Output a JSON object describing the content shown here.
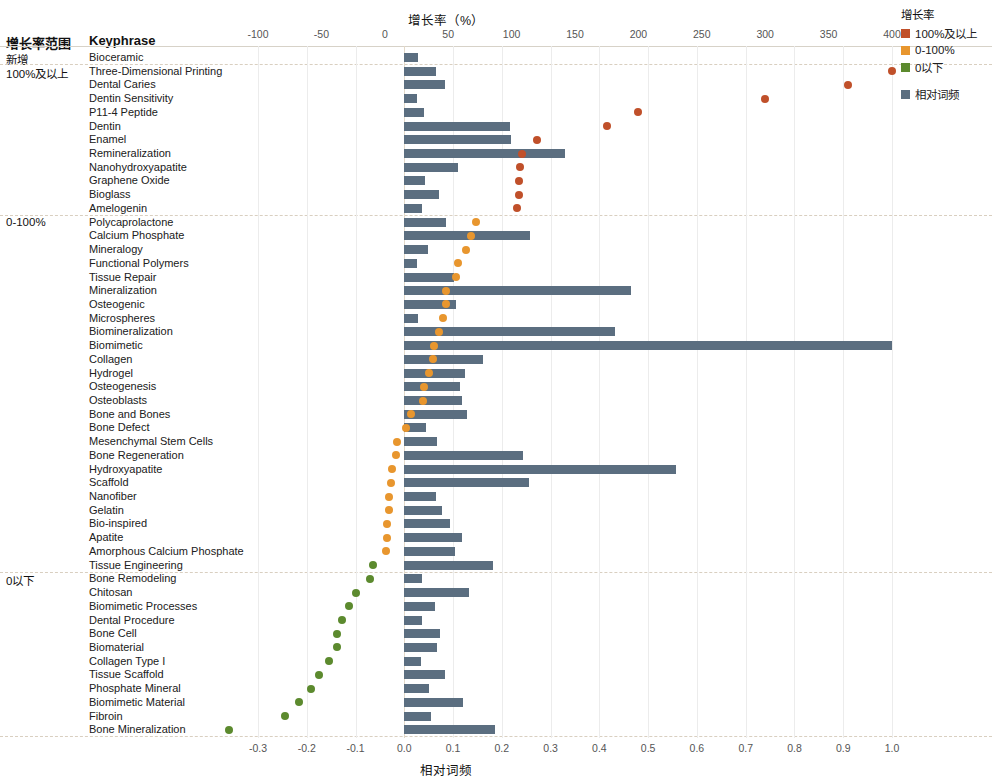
{
  "headers": {
    "group_col": "增长率范围",
    "keyphrase_col": "Keyphrase"
  },
  "axes": {
    "top_title": "增长率（%）",
    "bottom_title": "相对词频",
    "top_ticks": [
      "-100",
      "-50",
      "0",
      "50",
      "100",
      "150",
      "200",
      "250",
      "300",
      "350",
      "400"
    ],
    "bottom_ticks": [
      "-0.3",
      "-0.2",
      "-0.1",
      "0.0",
      "0.1",
      "0.2",
      "0.3",
      "0.4",
      "0.5",
      "0.6",
      "0.7",
      "0.8",
      "0.9",
      "1.0"
    ]
  },
  "legend": {
    "title": "增长率",
    "items": [
      {
        "label": "100%及以上",
        "color": "#c0502a"
      },
      {
        "label": "0-100%",
        "color": "#e8962e"
      },
      {
        "label": "0以下",
        "color": "#5c8a2e"
      }
    ],
    "freq": {
      "label": "相对词频",
      "color": "#5b6e80"
    }
  },
  "groups": [
    {
      "label": "新增",
      "first_row": 0
    },
    {
      "label": "100%及以上",
      "first_row": 1
    },
    {
      "label": "0-100%",
      "first_row": 12
    },
    {
      "label": "0以下",
      "first_row": 38
    }
  ],
  "colors": {
    "bar": "#5b6e80",
    "growth_high": "#c0502a",
    "growth_mid": "#e8962e",
    "growth_low": "#5c8a2e"
  },
  "chart_data": {
    "type": "bar",
    "xlabel_top": "增长率（%）",
    "xlabel_bottom": "相对词频",
    "ylabel": "Keyphrase",
    "xlim_top": [
      -100,
      400
    ],
    "xlim_bottom": [
      -0.3,
      1.0
    ],
    "grid": true,
    "legend_position": "right",
    "series": [
      {
        "name": "相对词频",
        "type": "bar",
        "color": "#5b6e80",
        "axis": "bottom"
      },
      {
        "name": "增长率",
        "type": "scatter",
        "axis": "top"
      }
    ],
    "categories": [
      "Bioceramic",
      "Three-Dimensional Printing",
      "Dental Caries",
      "Dentin Sensitivity",
      "P11-4 Peptide",
      "Dentin",
      "Enamel",
      "Remineralization",
      "Nanohydroxyapatite",
      "Graphene Oxide",
      "Bioglass",
      "Amelogenin",
      "Polycaprolactone",
      "Calcium Phosphate",
      "Mineralogy",
      "Functional Polymers",
      "Tissue Repair",
      "Mineralization",
      "Osteogenic",
      "Microspheres",
      "Biomineralization",
      "Biomimetic",
      "Collagen",
      "Hydrogel",
      "Osteogenesis",
      "Osteoblasts",
      "Bone and Bones",
      "Bone Defect",
      "Mesenchymal Stem Cells",
      "Bone Regeneration",
      "Hydroxyapatite",
      "Scaffold",
      "Nanofiber",
      "Gelatin",
      "Bio-inspired",
      "Apatite",
      "Amorphous Calcium Phosphate",
      "Tissue Engineering",
      "Bone Remodeling",
      "Chitosan",
      "Biomimetic Processes",
      "Dental Procedure",
      "Bone Cell",
      "Biomaterial",
      "Collagen Type I",
      "Tissue Scaffold",
      "Phosphate Mineral",
      "Biomimetic Material",
      "Fibroin",
      "Bone Mineralization"
    ],
    "rows": [
      {
        "keyphrase": "Bioceramic",
        "group": "新增",
        "rel_freq": 0.029,
        "growth": null
      },
      {
        "keyphrase": "Three-Dimensional Printing",
        "group": "100%及以上",
        "rel_freq": 0.066,
        "growth": 400
      },
      {
        "keyphrase": "Dental Caries",
        "group": "100%及以上",
        "rel_freq": 0.083,
        "growth": 365
      },
      {
        "keyphrase": "Dentin Sensitivity",
        "group": "100%及以上",
        "rel_freq": 0.026,
        "growth": 300
      },
      {
        "keyphrase": "P11-4 Peptide",
        "group": "100%及以上",
        "rel_freq": 0.041,
        "growth": 200
      },
      {
        "keyphrase": "Dentin",
        "group": "100%及以上",
        "rel_freq": 0.216,
        "growth": 175
      },
      {
        "keyphrase": "Enamel",
        "group": "100%及以上",
        "rel_freq": 0.218,
        "growth": 120
      },
      {
        "keyphrase": "Remineralization",
        "group": "100%及以上",
        "rel_freq": 0.33,
        "growth": 108
      },
      {
        "keyphrase": "Nanohydroxyapatite",
        "group": "100%及以上",
        "rel_freq": 0.11,
        "growth": 107
      },
      {
        "keyphrase": "Graphene Oxide",
        "group": "100%及以上",
        "rel_freq": 0.043,
        "growth": 106
      },
      {
        "keyphrase": "Bioglass",
        "group": "100%及以上",
        "rel_freq": 0.071,
        "growth": 106
      },
      {
        "keyphrase": "Amelogenin",
        "group": "100%及以上",
        "rel_freq": 0.036,
        "growth": 104
      },
      {
        "keyphrase": "Polycaprolactone",
        "group": "0-100%",
        "rel_freq": 0.085,
        "growth": 72
      },
      {
        "keyphrase": "Calcium Phosphate",
        "group": "0-100%",
        "rel_freq": 0.258,
        "growth": 68
      },
      {
        "keyphrase": "Mineralogy",
        "group": "0-100%",
        "rel_freq": 0.048,
        "growth": 64
      },
      {
        "keyphrase": "Functional Polymers",
        "group": "0-100%",
        "rel_freq": 0.026,
        "growth": 58
      },
      {
        "keyphrase": "Tissue Repair",
        "group": "0-100%",
        "rel_freq": 0.101,
        "growth": 56
      },
      {
        "keyphrase": "Mineralization",
        "group": "0-100%",
        "rel_freq": 0.464,
        "growth": 48
      },
      {
        "keyphrase": "Osteogenic",
        "group": "0-100%",
        "rel_freq": 0.105,
        "growth": 48
      },
      {
        "keyphrase": "Microspheres",
        "group": "0-100%",
        "rel_freq": 0.028,
        "growth": 46
      },
      {
        "keyphrase": "Biomineralization",
        "group": "0-100%",
        "rel_freq": 0.432,
        "growth": 43
      },
      {
        "keyphrase": "Biomimetic",
        "group": "0-100%",
        "rel_freq": 1.0,
        "growth": 39
      },
      {
        "keyphrase": "Collagen",
        "group": "0-100%",
        "rel_freq": 0.161,
        "growth": 38
      },
      {
        "keyphrase": "Hydrogel",
        "group": "0-100%",
        "rel_freq": 0.124,
        "growth": 35
      },
      {
        "keyphrase": "Osteogenesis",
        "group": "0-100%",
        "rel_freq": 0.115,
        "growth": 31
      },
      {
        "keyphrase": "Osteoblasts",
        "group": "0-100%",
        "rel_freq": 0.118,
        "growth": 30
      },
      {
        "keyphrase": "Bone and Bones",
        "group": "0-100%",
        "rel_freq": 0.128,
        "growth": 21
      },
      {
        "keyphrase": "Bone Defect",
        "group": "0-100%",
        "rel_freq": 0.044,
        "growth": 17
      },
      {
        "keyphrase": "Mesenchymal Stem Cells",
        "group": "0-100%",
        "rel_freq": 0.067,
        "growth": 10
      },
      {
        "keyphrase": "Bone Regeneration",
        "group": "0-100%",
        "rel_freq": 0.243,
        "growth": 9
      },
      {
        "keyphrase": "Hydroxyapatite",
        "group": "0-100%",
        "rel_freq": 0.557,
        "growth": 6
      },
      {
        "keyphrase": "Scaffold",
        "group": "0-100%",
        "rel_freq": 0.255,
        "growth": 5
      },
      {
        "keyphrase": "Nanofiber",
        "group": "0-100%",
        "rel_freq": 0.064,
        "growth": 3
      },
      {
        "keyphrase": "Gelatin",
        "group": "0-100%",
        "rel_freq": 0.078,
        "growth": 3
      },
      {
        "keyphrase": "Bio-inspired",
        "group": "0-100%",
        "rel_freq": 0.093,
        "growth": 2
      },
      {
        "keyphrase": "Apatite",
        "group": "0-100%",
        "rel_freq": 0.119,
        "growth": 2
      },
      {
        "keyphrase": "Amorphous Calcium Phosphate",
        "group": "0-100%",
        "rel_freq": 0.103,
        "growth": 1
      },
      {
        "keyphrase": "Tissue Engineering",
        "group": "0以下",
        "rel_freq": 0.182,
        "growth": -9
      },
      {
        "keyphrase": "Bone Remodeling",
        "group": "0以下",
        "rel_freq": 0.037,
        "growth": -12
      },
      {
        "keyphrase": "Chitosan",
        "group": "0以下",
        "rel_freq": 0.133,
        "growth": -23
      },
      {
        "keyphrase": "Biomimetic Processes",
        "group": "0以下",
        "rel_freq": 0.062,
        "growth": -28
      },
      {
        "keyphrase": "Dental Procedure",
        "group": "0以下",
        "rel_freq": 0.036,
        "growth": -34
      },
      {
        "keyphrase": "Bone Cell",
        "group": "0以下",
        "rel_freq": 0.073,
        "growth": -38
      },
      {
        "keyphrase": "Biomaterial",
        "group": "0以下",
        "rel_freq": 0.068,
        "growth": -38
      },
      {
        "keyphrase": "Collagen Type I",
        "group": "0以下",
        "rel_freq": 0.034,
        "growth": -44
      },
      {
        "keyphrase": "Tissue Scaffold",
        "group": "0以下",
        "rel_freq": 0.084,
        "growth": -52
      },
      {
        "keyphrase": "Phosphate Mineral",
        "group": "0以下",
        "rel_freq": 0.051,
        "growth": -58
      },
      {
        "keyphrase": "Biomimetic Material",
        "group": "0以下",
        "rel_freq": 0.121,
        "growth": -68
      },
      {
        "keyphrase": "Fibroin",
        "group": "0以下",
        "rel_freq": 0.054,
        "growth": -79
      },
      {
        "keyphrase": "Bone Mineralization",
        "group": "0以下",
        "rel_freq": 0.185,
        "growth": -123
      }
    ]
  }
}
